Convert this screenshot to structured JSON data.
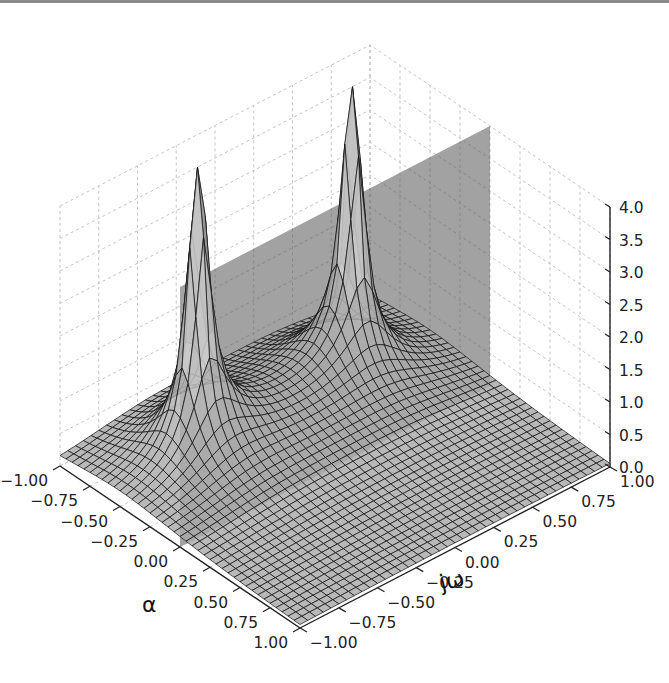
{
  "chart_data": {
    "type": "surface3d",
    "title": "",
    "xlabel": "α",
    "ylabel": "jω",
    "zlabel": "",
    "x_ticks": [
      "−1.00",
      "−0.75",
      "−0.50",
      "−0.25",
      "0.00",
      "0.25",
      "0.50",
      "0.75",
      "1.00"
    ],
    "y_ticks": [
      "−1.00",
      "−0.75",
      "−0.50",
      "−0.25",
      "0.00",
      "0.25",
      "0.50",
      "0.75",
      "1.00"
    ],
    "z_ticks": [
      "0.0",
      "0.5",
      "1.0",
      "1.5",
      "2.0",
      "2.5",
      "3.0",
      "3.5",
      "4.0"
    ],
    "xlim": [
      -1,
      1
    ],
    "ylim": [
      -1,
      1
    ],
    "zlim": [
      0,
      4
    ],
    "grid": true,
    "surface": {
      "colormap": "gray",
      "edgecolor": "#000000",
      "mesh_resolution": 40,
      "peaks": [
        {
          "alpha": -0.5,
          "jw": -0.5,
          "z": "clipped > 4"
        },
        {
          "alpha": -0.5,
          "jw": 0.5,
          "z": "clipped > 4"
        }
      ]
    },
    "plane": {
      "alpha": 0,
      "color": "#555555",
      "opacity": 0.55,
      "z_range": [
        0,
        4
      ]
    }
  },
  "axes": {
    "alpha_label": "α",
    "jw_label": "jω"
  }
}
